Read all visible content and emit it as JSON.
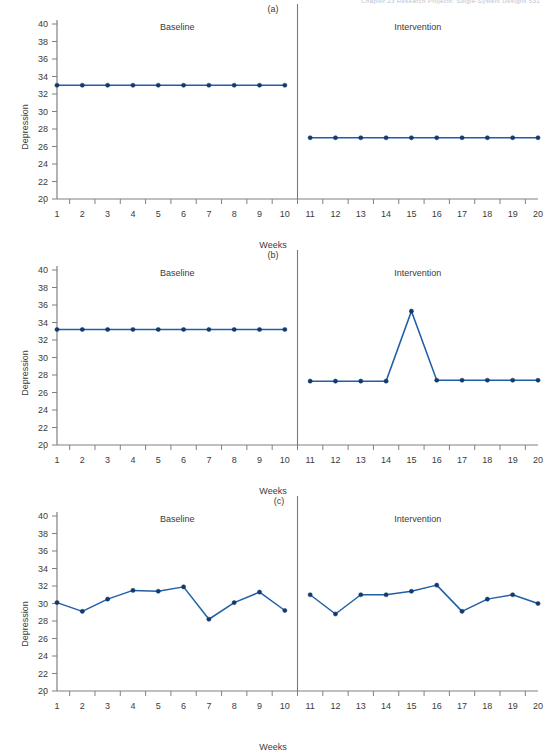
{
  "running_head": "Chapter 23    Research Projects: Single-System Designs   531",
  "figure": {
    "y_axis_label": "Depression",
    "x_axis_label": "Weeks",
    "phase_baseline": "Baseline",
    "phase_intervention": "Intervention",
    "y_ticks": [
      40,
      38,
      36,
      34,
      32,
      30,
      28,
      26,
      24,
      22,
      20
    ],
    "x_ticks": [
      1,
      2,
      3,
      4,
      5,
      6,
      7,
      8,
      9,
      10,
      11,
      12,
      13,
      14,
      15,
      16,
      17,
      18,
      19,
      20
    ],
    "line_color": "#1f5fa8",
    "marker_color": "#123a6b",
    "axis_color": "#808080",
    "divider_color": "#7a7a7a"
  },
  "chart_data": [
    {
      "type": "line",
      "title": "(a)",
      "xlabel": "Weeks",
      "ylabel": "Depression",
      "ylim": [
        20,
        40
      ],
      "xlim": [
        1,
        20
      ],
      "grid": false,
      "legend": "none",
      "annotations": [
        "Baseline",
        "Intervention"
      ],
      "phase_change_after_x": 10,
      "x": [
        1,
        2,
        3,
        4,
        5,
        6,
        7,
        8,
        9,
        10
      ],
      "series": [
        {
          "name": "Baseline",
          "x": [
            1,
            2,
            3,
            4,
            5,
            6,
            7,
            8,
            9,
            10
          ],
          "values": [
            33.0,
            33.0,
            33.0,
            33.0,
            33.0,
            33.0,
            33.0,
            33.0,
            33.0,
            33.0
          ]
        },
        {
          "name": "Intervention",
          "x": [
            11,
            12,
            13,
            14,
            15,
            16,
            17,
            18,
            19,
            20
          ],
          "values": [
            27.0,
            27.0,
            27.0,
            27.0,
            27.0,
            27.0,
            27.0,
            27.0,
            27.0,
            27.0
          ]
        }
      ]
    },
    {
      "type": "line",
      "title": "(b)",
      "xlabel": "Weeks",
      "ylabel": "Depression",
      "ylim": [
        20,
        40
      ],
      "xlim": [
        1,
        20
      ],
      "grid": false,
      "legend": "none",
      "annotations": [
        "Baseline",
        "Intervention"
      ],
      "phase_change_after_x": 10,
      "series": [
        {
          "name": "Baseline",
          "x": [
            1,
            2,
            3,
            4,
            5,
            6,
            7,
            8,
            9,
            10
          ],
          "values": [
            33.2,
            33.2,
            33.2,
            33.2,
            33.2,
            33.2,
            33.2,
            33.2,
            33.2,
            33.2
          ]
        },
        {
          "name": "Intervention",
          "x": [
            11,
            12,
            13,
            14,
            15,
            16,
            17,
            18,
            19,
            20
          ],
          "values": [
            27.3,
            27.3,
            27.3,
            27.3,
            35.3,
            27.4,
            27.4,
            27.4,
            27.4,
            27.4
          ]
        }
      ]
    },
    {
      "type": "line",
      "title": "(c)",
      "xlabel": "Weeks",
      "ylabel": "Depression",
      "ylim": [
        20,
        40
      ],
      "xlim": [
        1,
        20
      ],
      "grid": false,
      "legend": "none",
      "annotations": [
        "Baseline",
        "Intervention"
      ],
      "phase_change_after_x": 10,
      "series": [
        {
          "name": "Baseline",
          "x": [
            1,
            2,
            3,
            4,
            5,
            6,
            7,
            8,
            9,
            10
          ],
          "values": [
            30.1,
            29.1,
            30.5,
            31.5,
            31.4,
            31.9,
            28.2,
            30.1,
            31.3,
            29.2
          ]
        },
        {
          "name": "Intervention",
          "x": [
            11,
            12,
            13,
            14,
            15,
            16,
            17,
            18,
            19,
            20
          ],
          "values": [
            31.0,
            28.8,
            31.0,
            31.0,
            31.4,
            32.1,
            29.1,
            30.5,
            31.0,
            30.0
          ]
        }
      ]
    }
  ]
}
